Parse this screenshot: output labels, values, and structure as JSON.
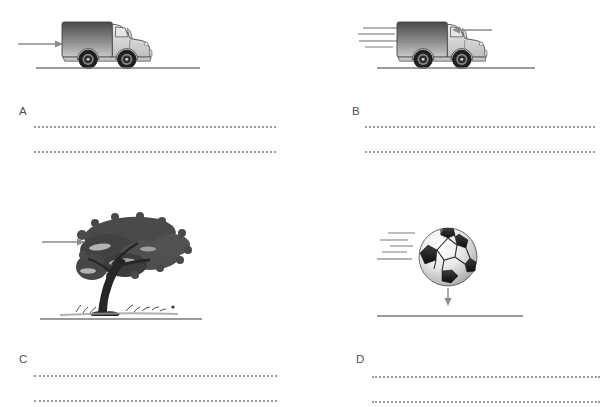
{
  "colors": {
    "arrow": "#8a8a8a",
    "ground_line": "#7a7a7a",
    "dotted_line": "#9b9b9b",
    "label": "#4f4f4f",
    "figure_dark": "#1f1f1f"
  },
  "panels": [
    {
      "label": "A",
      "figure": "truck-with-force-arrow-pointing-right",
      "answer_lines": 2
    },
    {
      "label": "B",
      "figure": "moving-truck-with-force-arrow-pointing-left",
      "answer_lines": 2
    },
    {
      "label": "C",
      "figure": "windblown-tree-with-force-arrow-pointing-right",
      "answer_lines": 2
    },
    {
      "label": "D",
      "figure": "moving-ball-with-downward-force-arrow",
      "answer_lines": 2
    }
  ]
}
